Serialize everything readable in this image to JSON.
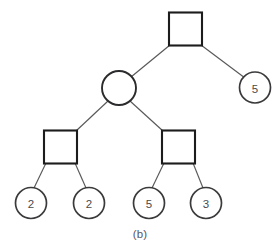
{
  "figure": {
    "caption": "(b)",
    "kind": "tree-diagram",
    "background_color": "#ffffff",
    "square_stroke_color": "#1c1c1c",
    "circle_stroke_color": "#3a3a3c",
    "edge_stroke_color": "#58585a",
    "label_color": "#4a4a4c"
  },
  "tree": {
    "nodes": [
      {
        "id": "n-root",
        "name": "root-square-node",
        "shape": "square",
        "label": "",
        "cx": 185.5,
        "cy": 29,
        "size": 33,
        "level": 0
      },
      {
        "id": "n-right-5",
        "name": "leaf-circle-5-right",
        "shape": "circle",
        "label": "5",
        "cx": 255,
        "cy": 87.5,
        "r": 15.5,
        "level": 1
      },
      {
        "id": "n-mid-circle",
        "name": "internal-circle-node",
        "shape": "circle",
        "label": "",
        "cx": 119,
        "cy": 88,
        "r": 17,
        "level": 1
      },
      {
        "id": "n-left-square",
        "name": "left-square-node",
        "shape": "square",
        "label": "",
        "cx": 60.5,
        "cy": 147,
        "size": 33,
        "level": 2
      },
      {
        "id": "n-right-square",
        "name": "right-square-node",
        "shape": "square",
        "label": "",
        "cx": 178.5,
        "cy": 147,
        "size": 33,
        "level": 2
      },
      {
        "id": "n-leaf-1",
        "name": "leaf-circle-2-first",
        "shape": "circle",
        "label": "2",
        "cx": 31,
        "cy": 203,
        "r": 15.5,
        "level": 3
      },
      {
        "id": "n-leaf-2",
        "name": "leaf-circle-2-second",
        "shape": "circle",
        "label": "2",
        "cx": 89,
        "cy": 203,
        "r": 15.5,
        "level": 3
      },
      {
        "id": "n-leaf-3",
        "name": "leaf-circle-5-bottom",
        "shape": "circle",
        "label": "5",
        "cx": 149,
        "cy": 203,
        "r": 15.5,
        "level": 3
      },
      {
        "id": "n-leaf-4",
        "name": "leaf-circle-3",
        "shape": "circle",
        "label": "3",
        "cx": 206,
        "cy": 203,
        "r": 15.5,
        "level": 3
      }
    ],
    "edges": [
      {
        "name": "edge-root-to-circle",
        "x1": 170,
        "y1": 45,
        "x2": 131,
        "y2": 77
      },
      {
        "name": "edge-root-to-right-leaf",
        "x1": 201,
        "y1": 45,
        "x2": 245,
        "y2": 78
      },
      {
        "name": "edge-circle-to-left-square",
        "x1": 108,
        "y1": 101,
        "x2": 76,
        "y2": 131
      },
      {
        "name": "edge-circle-to-right-square",
        "x1": 130,
        "y1": 101,
        "x2": 163,
        "y2": 131
      },
      {
        "name": "edge-left-square-to-leaf1",
        "x1": 46,
        "y1": 163,
        "x2": 34,
        "y2": 188
      },
      {
        "name": "edge-left-square-to-leaf2",
        "x1": 75,
        "y1": 163,
        "x2": 86,
        "y2": 188
      },
      {
        "name": "edge-right-square-to-leaf3",
        "x1": 164,
        "y1": 163,
        "x2": 152,
        "y2": 188
      },
      {
        "name": "edge-right-square-to-leaf4",
        "x1": 193,
        "y1": 163,
        "x2": 203,
        "y2": 188
      }
    ]
  }
}
